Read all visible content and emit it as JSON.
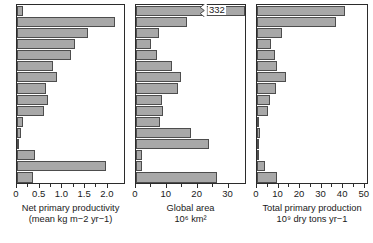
{
  "chart_data": {
    "type": "bar",
    "title": "",
    "orientation": "horizontal",
    "shared_categories_hidden": true,
    "categories": [
      "Open ocean",
      "Tropical rain forest",
      "Tropical seasonal forest",
      "Temperate evergreen forest",
      "Temperate deciduous forest",
      "Boreal forest",
      "Savanna",
      "Cultivated land",
      "Woodland and shrubland",
      "Temperate grassland",
      "Tundra and alpine",
      "Desert and semidesert scrub",
      "Extreme desert, rock, sand, ice",
      "Lake and stream",
      "Swamp and marsh",
      "Continental shelf"
    ],
    "panels": [
      {
        "id": "net-primary-productivity",
        "xlabel_line1": "Net primary productivity",
        "xlabel_line2": "(mean kg m−2 yr−1)",
        "units": "kg m^-2 yr^-1",
        "xlim": [
          0,
          2.4
        ],
        "ticks": [
          0,
          0.5,
          1.0,
          1.5,
          2.0
        ],
        "ticklabels": [
          "0",
          "0.5",
          "1.0",
          "1.5",
          "2.0"
        ],
        "values": [
          0.125,
          2.2,
          1.6,
          1.3,
          1.2,
          0.8,
          0.9,
          0.65,
          0.7,
          0.6,
          0.14,
          0.09,
          0.003,
          0.4,
          2.0,
          0.36
        ]
      },
      {
        "id": "global-area",
        "xlabel_line1": "Global area",
        "xlabel_line2": "10⁶ km²",
        "units": "10^6 km^2",
        "xlim": [
          0,
          36
        ],
        "ticks": [
          0,
          10,
          20,
          30
        ],
        "ticklabels": [
          "0",
          "10",
          "20",
          "30"
        ],
        "values": [
          332,
          17.0,
          7.5,
          5.0,
          7.0,
          12.0,
          15.0,
          14.0,
          8.5,
          9.0,
          8.0,
          18.0,
          24.0,
          2.0,
          2.0,
          26.6
        ],
        "broken_bar": {
          "index": 0,
          "value": 332,
          "label": "332"
        }
      },
      {
        "id": "total-primary-production",
        "xlabel_line1": "Total primary production",
        "xlabel_line2": "10⁹ dry tons yr−1",
        "units": "10^9 dry tons yr^-1",
        "xlim": [
          0,
          52
        ],
        "ticks": [
          0,
          10,
          20,
          30,
          40,
          50
        ],
        "ticklabels": [
          "0",
          "10",
          "20",
          "30",
          "40",
          "50"
        ],
        "values": [
          41.5,
          37.4,
          12.0,
          6.4,
          8.4,
          9.6,
          13.5,
          9.1,
          6.0,
          5.4,
          1.1,
          1.6,
          0.07,
          0.8,
          4.0,
          9.6
        ]
      }
    ],
    "bar_fill_color": "#a8a8a8",
    "bar_edge_color": "#4d4d4d",
    "axis_color": "#2b2b2b",
    "grid": false,
    "legend": null
  }
}
